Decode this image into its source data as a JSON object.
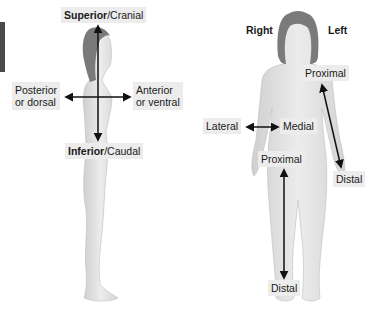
{
  "lateral_view": {
    "superior": {
      "bold": "Superior",
      "rest": "/Cranial"
    },
    "inferior": {
      "bold": "Inferior",
      "rest": "/Caudal"
    },
    "posterior": {
      "line1": "Posterior",
      "line2": "or dorsal"
    },
    "anterior": {
      "line1": "Anterior",
      "line2": "or ventral"
    }
  },
  "anterior_view": {
    "right": "Right",
    "left": "Left",
    "lateral": "Lateral",
    "medial": "Medial",
    "arm_proximal": "Proximal",
    "arm_distal": "Distal",
    "leg_proximal": "Proximal",
    "leg_distal": "Distal"
  },
  "colors": {
    "skin": "#e4e4e4",
    "skin_shadow": "#c9c9c9",
    "hair": "#7a7a7a",
    "arrow": "#111111",
    "label_bg": "#ececec"
  }
}
